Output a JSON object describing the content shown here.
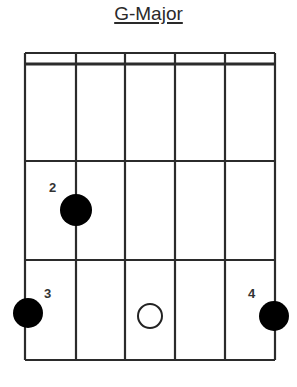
{
  "title": "G-Major",
  "chart": {
    "strings": 6,
    "frets": 3,
    "colors": {
      "line": "#2b2b2b",
      "dot": "#000000",
      "open": "#ffffff"
    },
    "fingers": [
      {
        "string": 2,
        "fret": 2,
        "label": "2"
      },
      {
        "string": 1,
        "fret": 3,
        "label": "3"
      },
      {
        "string": 6,
        "fret": 3,
        "label": "4"
      }
    ],
    "open_markers": [
      {
        "position": "fret-3-string-3-gap",
        "label": ""
      }
    ]
  }
}
